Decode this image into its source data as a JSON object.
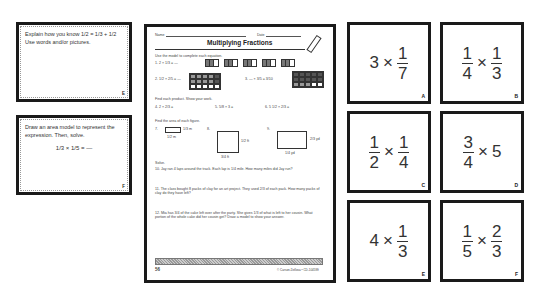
{
  "task_cards": [
    {
      "text": "Explain how you know",
      "expr": "1/2 = 1/3 + 1/2",
      "text2": "Use words and/or pictures.",
      "letter": "E"
    },
    {
      "text": "Draw an area model to represent the expression. Then, solve.",
      "expr": "1/3 × 1/5 = —",
      "letter": "F"
    }
  ],
  "worksheet": {
    "name_label": "Name",
    "date_label": "Date",
    "title": "Multiplying Fractions",
    "section1": "Use the model to complete each equation.",
    "q1": "1.  2 × 1/3 = —",
    "q2": "2.  1/2 × 2/5 = —",
    "q3": "3.  — × 3/5 = 3/10",
    "section2": "Find each product. Show your work.",
    "q4": "4.  2 × 2/3 =",
    "q5": "5.  5/8 × 3 =",
    "q6": "6.  5 1/2 × 2/3 =",
    "section3": "Find the area of each figure.",
    "q7": "7.",
    "q7_w": "1/3 m",
    "q7_h": "1/2 m",
    "q8": "8.",
    "q8_w": "1/2 ft",
    "q8_h": "3/4 ft",
    "q9": "9.",
    "q9_w": "2/3 yd",
    "q9_h": "1/4 yd",
    "solve": "Solve.",
    "q10": "10. Jay ran 4 laps around the track. Each lap is 1/4 mile. How many miles did Jay run?",
    "q11": "11. The class bought 8 packs of clay for an art project. They used 2/3 of each pack. How many packs of clay do they have left?",
    "q12": "12. Mia has 3/4 of the cake left over after the party. She gives 1/3 of what is left to her cousin. What portion of the whole cake did her cousin get? Draw a model to show your answer.",
    "page_number": "56",
    "copyright": "© Carson-Dellosa • CD-104599"
  },
  "expression_cards": [
    {
      "letter": "A",
      "parts": [
        {
          "whole": "3"
        },
        {
          "op": "×"
        },
        {
          "num": "1",
          "den": "7"
        }
      ]
    },
    {
      "letter": "B",
      "parts": [
        {
          "num": "1",
          "den": "4"
        },
        {
          "op": "×"
        },
        {
          "num": "1",
          "den": "3"
        }
      ]
    },
    {
      "letter": "C",
      "parts": [
        {
          "num": "1",
          "den": "2"
        },
        {
          "op": "×"
        },
        {
          "num": "1",
          "den": "4"
        }
      ]
    },
    {
      "letter": "D",
      "parts": [
        {
          "num": "3",
          "den": "4"
        },
        {
          "op": "×"
        },
        {
          "whole": "5"
        }
      ]
    },
    {
      "letter": "E",
      "parts": [
        {
          "whole": "4"
        },
        {
          "op": "×"
        },
        {
          "num": "1",
          "den": "3"
        }
      ]
    },
    {
      "letter": "F",
      "parts": [
        {
          "num": "1",
          "den": "5"
        },
        {
          "op": "×"
        },
        {
          "num": "2",
          "den": "3"
        }
      ]
    }
  ]
}
